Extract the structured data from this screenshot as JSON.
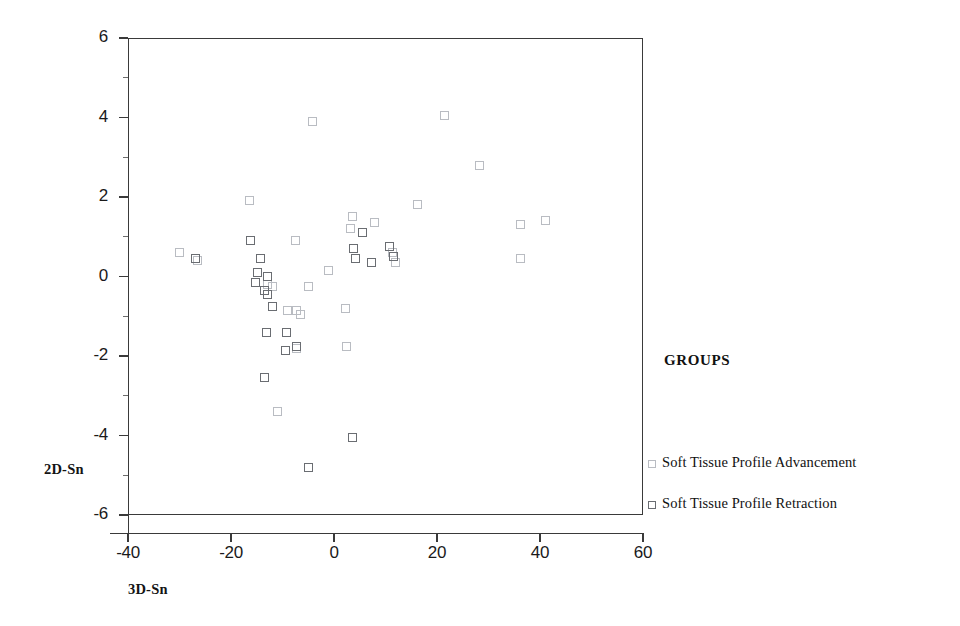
{
  "chart_data": {
    "type": "scatter",
    "title": "",
    "xlabel": "3D-Sn",
    "ylabel": "2D-Sn",
    "xlim": [
      -40,
      60
    ],
    "ylim": [
      -6,
      6
    ],
    "xticks": [
      -40,
      -20,
      0,
      20,
      40,
      60
    ],
    "yticks": [
      6,
      4,
      2,
      0,
      -2,
      -4,
      -6
    ],
    "grid": false,
    "legend_position": "right",
    "legend_title": "GROUPS",
    "series": [
      {
        "name": "Soft Tissue Profile Advancement",
        "marker": "open-square",
        "color": "#b9bcc2",
        "points": [
          [
            -30.0,
            0.6
          ],
          [
            -26.5,
            0.4
          ],
          [
            -16.5,
            1.9
          ],
          [
            -4.2,
            3.9
          ],
          [
            21.5,
            4.05
          ],
          [
            28.2,
            2.8
          ],
          [
            16.3,
            1.8
          ],
          [
            3.6,
            1.5
          ],
          [
            3.3,
            1.2
          ],
          [
            7.8,
            1.35
          ],
          [
            36.2,
            1.3
          ],
          [
            41.0,
            1.4
          ],
          [
            11.3,
            0.6
          ],
          [
            12.0,
            0.35
          ],
          [
            36.3,
            0.45
          ],
          [
            -1.0,
            0.15
          ],
          [
            -7.5,
            0.9
          ],
          [
            -5.0,
            -0.25
          ],
          [
            -7.3,
            -0.85
          ],
          [
            -6.5,
            -0.95
          ],
          [
            2.3,
            -0.8
          ],
          [
            -9.0,
            -0.85
          ],
          [
            2.5,
            -1.75
          ],
          [
            -11.0,
            -3.4
          ],
          [
            -7.3,
            -1.8
          ],
          [
            -12.0,
            -0.25
          ],
          [
            -13.0,
            -0.2
          ]
        ]
      },
      {
        "name": "Soft Tissue Profile Retraction",
        "marker": "open-square",
        "color": "#6a6d72",
        "points": [
          [
            -26.8,
            0.45
          ],
          [
            -16.3,
            0.9
          ],
          [
            -14.3,
            0.45
          ],
          [
            -14.8,
            0.1
          ],
          [
            -13.0,
            0.0
          ],
          [
            -15.2,
            -0.15
          ],
          [
            -13.5,
            -0.35
          ],
          [
            -13.0,
            -0.45
          ],
          [
            -12.0,
            -0.75
          ],
          [
            -13.2,
            -1.4
          ],
          [
            -9.2,
            -1.4
          ],
          [
            -9.5,
            -1.85
          ],
          [
            -7.3,
            -1.75
          ],
          [
            -13.5,
            -2.55
          ],
          [
            -5.0,
            -4.8
          ],
          [
            3.8,
            0.7
          ],
          [
            4.2,
            0.45
          ],
          [
            5.6,
            1.1
          ],
          [
            3.5,
            -4.05
          ],
          [
            10.8,
            0.75
          ],
          [
            11.5,
            0.5
          ],
          [
            7.3,
            0.35
          ]
        ]
      }
    ]
  },
  "axes": {
    "y_tick_labels": [
      "6",
      "4",
      "2",
      "0",
      "-2",
      "-4",
      "-6"
    ],
    "x_tick_labels": [
      "-40",
      "-20",
      "0",
      "20",
      "40",
      "60"
    ],
    "y_title": "2D-Sn",
    "x_title": "3D-Sn"
  },
  "legend": {
    "title": "GROUPS",
    "entries": [
      {
        "label": "Soft Tissue Profile Advancement",
        "group": 0
      },
      {
        "label": "Soft Tissue Profile Retraction",
        "group": 1
      }
    ]
  }
}
